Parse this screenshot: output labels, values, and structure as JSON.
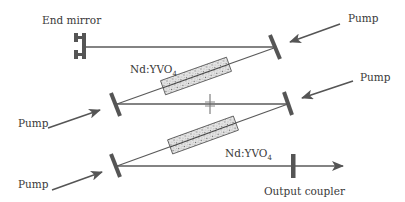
{
  "diagram": {
    "type": "laser-cavity-schematic",
    "labels": {
      "end_mirror": "End mirror",
      "crystal_top": "Nd:YVO",
      "crystal_top_sub": "4",
      "crystal_bottom": "Nd:YVO",
      "crystal_bottom_sub": "4",
      "output_coupler": "Output coupler",
      "pump_top_right": "Pump",
      "pump_mid_right": "Pump",
      "pump_mid_left": "Pump",
      "pump_bottom_left": "Pump"
    },
    "components": [
      {
        "id": "end-mirror",
        "kind": "mirror"
      },
      {
        "id": "fold-mirror-top-right",
        "kind": "mirror"
      },
      {
        "id": "fold-mirror-mid-left",
        "kind": "mirror"
      },
      {
        "id": "fold-mirror-mid-right",
        "kind": "mirror"
      },
      {
        "id": "fold-mirror-bottom-left",
        "kind": "mirror"
      },
      {
        "id": "crystal-1",
        "kind": "gain-medium",
        "material": "Nd:YVO4"
      },
      {
        "id": "crystal-2",
        "kind": "gain-medium",
        "material": "Nd:YVO4"
      },
      {
        "id": "aperture",
        "kind": "aperture"
      },
      {
        "id": "output-coupler",
        "kind": "output-coupler"
      }
    ],
    "colors": {
      "line": "#5a5a5a",
      "mirror": "#555555",
      "text": "#3a3a3a",
      "background": "#ffffff"
    }
  }
}
